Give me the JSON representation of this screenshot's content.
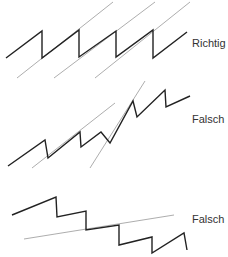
{
  "figures": [
    {
      "label": "Richtig",
      "zigzag": "6,58 42,31 42,58 79,30 79,57 116,31 116,57 153,30 153,58 187,32",
      "guides": [
        {
          "x1": 17,
          "y1": 78,
          "x2": 113,
          "y2": 2
        },
        {
          "x1": 54,
          "y1": 78,
          "x2": 155,
          "y2": 2
        },
        {
          "x1": 95,
          "y1": 78,
          "x2": 190,
          "y2": 2
        }
      ],
      "label_pos": {
        "x": 192,
        "y": 47
      }
    },
    {
      "label": "Falsch",
      "zigzag": "8,166 45,140 48,158 80,132 81,147 101,132 110,143 133,101 137,117 165,90 166,107 190,96",
      "guides": [
        {
          "x1": 32,
          "y1": 168,
          "x2": 115,
          "y2": 103
        },
        {
          "x1": 90,
          "y1": 168,
          "x2": 145,
          "y2": 81
        }
      ],
      "label_pos": {
        "x": 192,
        "y": 123
      }
    },
    {
      "label": "Falsch",
      "zigzag": "12,215 56,197 57,217 86,211 86,230 119,225 119,245 152,237 152,253 184,233 187,250",
      "guides": [
        {
          "x1": 24,
          "y1": 239,
          "x2": 174,
          "y2": 215
        }
      ],
      "label_pos": {
        "x": 192,
        "y": 223
      }
    }
  ],
  "colors": {
    "zigzag": "#222222",
    "guide": "#8a8a8a",
    "text": "#333333"
  }
}
